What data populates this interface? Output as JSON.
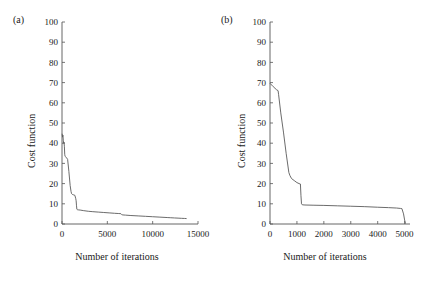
{
  "figure": {
    "background": "#ffffff",
    "line_color": "#5a5a5a",
    "axis_color": "#555555",
    "text_color": "#1a1a1a"
  },
  "panels": {
    "a": {
      "label": "(a)",
      "xlabel": "Number of iterations",
      "ylabel": "Cost function"
    },
    "b": {
      "label": "(b)",
      "xlabel": "Number of iterations",
      "ylabel": "Cost function"
    }
  },
  "chart_data": [
    {
      "type": "line",
      "panel": "a",
      "title": "(a)",
      "xlabel": "Number of iterations",
      "ylabel": "Cost function",
      "xlim": [
        0,
        15000
      ],
      "ylim": [
        0,
        100
      ],
      "xticks": [
        0,
        5000,
        10000,
        15000
      ],
      "xtick_labels": [
        "0",
        "5000",
        "10000",
        "15000"
      ],
      "yticks": [
        0,
        10,
        20,
        30,
        40,
        50,
        60,
        70,
        80,
        90,
        100
      ],
      "ytick_labels": [
        "0",
        "10",
        "20",
        "30",
        "40",
        "50",
        "60",
        "70",
        "80",
        "90",
        "100"
      ],
      "grid": false,
      "legend": null,
      "series": [
        {
          "name": "cost",
          "x": [
            20,
            60,
            100,
            140,
            180,
            220,
            260,
            300,
            340,
            420,
            500,
            620,
            760,
            900,
            1000,
            1060,
            1100,
            1160,
            1220,
            1300,
            1420,
            1520,
            1560,
            1600,
            1640,
            1700,
            1800,
            2000,
            2400,
            2900,
            3400,
            4000,
            4600,
            5200,
            5800,
            6200,
            6500,
            6600,
            6700,
            7000,
            7600,
            8400,
            9200,
            10000,
            10800,
            11600,
            12000,
            12400,
            12800,
            13200,
            13500,
            13700
          ],
          "y": [
            44.5,
            43.0,
            44.0,
            41.5,
            40.0,
            40.5,
            38.5,
            34.5,
            33.5,
            33.2,
            32.8,
            32.0,
            26.0,
            19.0,
            16.0,
            15.0,
            14.8,
            14.6,
            14.5,
            14.4,
            14.2,
            12.5,
            11.5,
            9.0,
            7.3,
            7.1,
            7.0,
            6.9,
            6.6,
            6.3,
            6.1,
            5.9,
            5.7,
            5.5,
            5.3,
            5.2,
            5.1,
            4.6,
            4.5,
            4.4,
            4.2,
            4.0,
            3.8,
            3.6,
            3.4,
            3.2,
            3.1,
            3.0,
            2.9,
            2.8,
            2.75,
            2.7
          ]
        }
      ]
    },
    {
      "type": "line",
      "panel": "b",
      "title": "(b)",
      "xlabel": "Number of iterations",
      "ylabel": "Cost function",
      "xlim": [
        0,
        5200
      ],
      "ylim": [
        0,
        100
      ],
      "xticks": [
        0,
        1000,
        2000,
        3000,
        4000,
        5000
      ],
      "xtick_labels": [
        "0",
        "1000",
        "2000",
        "3000",
        "4000",
        "5000"
      ],
      "yticks": [
        0,
        10,
        20,
        30,
        40,
        50,
        60,
        70,
        80,
        90,
        100
      ],
      "ytick_labels": [
        "0",
        "10",
        "20",
        "30",
        "40",
        "50",
        "60",
        "70",
        "80",
        "90",
        "100"
      ],
      "grid": false,
      "legend": null,
      "series": [
        {
          "name": "cost",
          "x": [
            10,
            120,
            240,
            300,
            320,
            400,
            500,
            600,
            700,
            740,
            800,
            900,
            1000,
            1080,
            1130,
            1150,
            1170,
            1200,
            1300,
            1600,
            2000,
            2500,
            3000,
            3500,
            4000,
            4400,
            4700,
            4850,
            4900,
            4960,
            5000,
            5030
          ],
          "y": [
            69.5,
            68.0,
            66.5,
            66.0,
            64.0,
            55.0,
            45.5,
            35.0,
            25.5,
            24.0,
            22.5,
            21.5,
            20.5,
            20.0,
            19.8,
            14.0,
            10.0,
            9.5,
            9.4,
            9.3,
            9.2,
            9.0,
            8.8,
            8.6,
            8.3,
            8.1,
            7.9,
            7.7,
            7.6,
            5.0,
            2.0,
            0.4
          ]
        }
      ]
    }
  ]
}
